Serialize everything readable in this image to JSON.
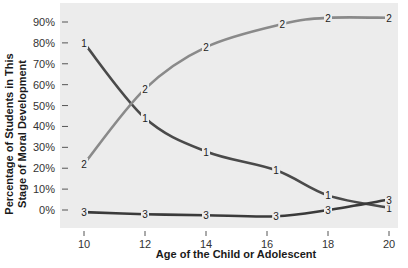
{
  "chart_data": {
    "type": "line",
    "title": "",
    "xlabel": "Age of the Child or Adolescent",
    "ylabel": "Percentage of Students in This Stage of Moral Development",
    "ylabel_lines": [
      "Percentage of Students in This",
      "Stage of Moral Development"
    ],
    "x_ticks": [
      10,
      12,
      14,
      16,
      18,
      20
    ],
    "y_ticks": [
      "0%",
      "10%",
      "20%",
      "30%",
      "40%",
      "50%",
      "60%",
      "70%",
      "80%",
      "90%"
    ],
    "xlim": [
      9.2,
      20.3
    ],
    "ylim": [
      -8,
      99
    ],
    "grid": false,
    "legend": "inline point labels (1, 2, 3)",
    "series": [
      {
        "name": "1",
        "color": "#4a4a4a",
        "x": [
          10,
          12,
          14,
          16.3,
          18,
          20
        ],
        "values": [
          80,
          44,
          28,
          19,
          7,
          1
        ]
      },
      {
        "name": "2",
        "color": "#8a8a8a",
        "x": [
          10,
          12,
          14,
          16.5,
          18,
          20
        ],
        "values": [
          22,
          58,
          78,
          89,
          92,
          92
        ]
      },
      {
        "name": "3",
        "color": "#3a3a3a",
        "x": [
          10,
          12,
          14,
          16.3,
          18,
          20
        ],
        "values": [
          -1,
          -2,
          -2.5,
          -3,
          0,
          5
        ]
      }
    ]
  }
}
